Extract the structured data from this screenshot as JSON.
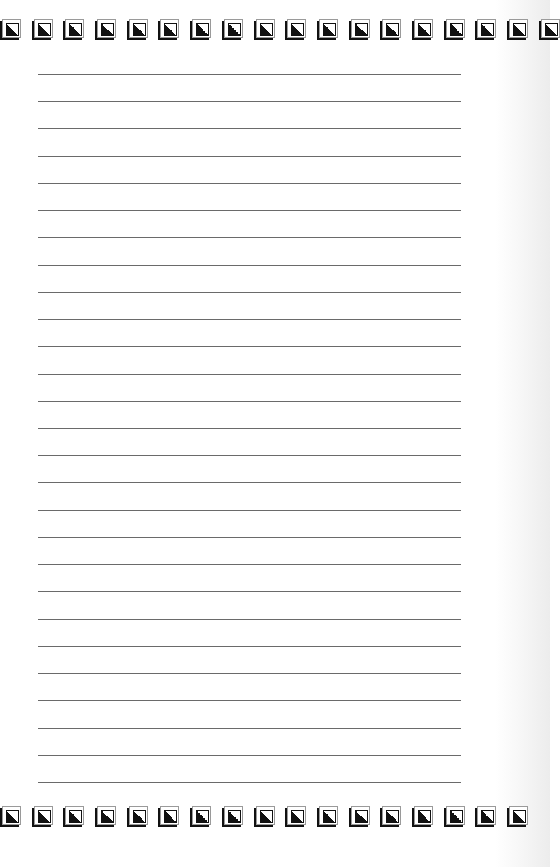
{
  "document": {
    "type": "lined-writing-page",
    "ruled_line_count": 27,
    "ruled_line_first_y": 74,
    "ruled_line_spacing": 27.23,
    "ruled_line_left": 38,
    "ruled_line_width": 423,
    "ruled_line_color": "#6a6a6a"
  },
  "border": {
    "icon": "bevel-square-triangle-icon",
    "top_row": {
      "y": 19,
      "tile_x": [
        0,
        32,
        63,
        95,
        127,
        158,
        190,
        222,
        254,
        285,
        317,
        349,
        380,
        412,
        444,
        475,
        507,
        539
      ]
    },
    "bottom_row": {
      "y": 806,
      "tile_x": [
        0,
        32,
        63,
        95,
        127,
        158,
        190,
        222,
        254,
        285,
        317,
        349,
        380,
        412,
        444,
        475,
        507
      ]
    },
    "colors": {
      "dark": "#111111",
      "frame": "#9a9a9a",
      "paper": "#ffffff"
    }
  }
}
